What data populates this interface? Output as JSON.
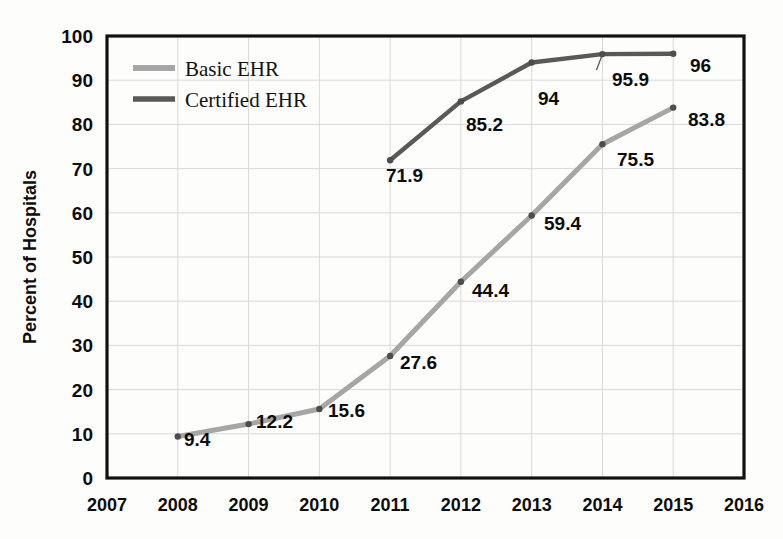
{
  "chart_data": {
    "type": "line",
    "title": "",
    "xlabel": "",
    "ylabel": "Percent of Hospitals",
    "x": [
      2007,
      2008,
      2009,
      2010,
      2011,
      2012,
      2013,
      2014,
      2015,
      2016
    ],
    "categories": [
      "2007",
      "2008",
      "2009",
      "2010",
      "2011",
      "2012",
      "2013",
      "2014",
      "2015",
      "2016"
    ],
    "xlim": [
      2007,
      2016
    ],
    "ylim": [
      0,
      100
    ],
    "ytick_labels": [
      "0",
      "10",
      "20",
      "30",
      "40",
      "50",
      "60",
      "70",
      "80",
      "90",
      "100"
    ],
    "yticks": [
      0,
      10,
      20,
      30,
      40,
      50,
      60,
      70,
      80,
      90,
      100
    ],
    "grid": true,
    "legend_position": "top-left",
    "series": [
      {
        "name": "Basic EHR",
        "color": "#a6a6a6",
        "x": [
          2008,
          2009,
          2010,
          2011,
          2012,
          2013,
          2014,
          2015
        ],
        "values": [
          9.4,
          12.2,
          15.6,
          27.6,
          44.4,
          59.4,
          75.5,
          83.8
        ],
        "labels": [
          "9.4",
          "12.2",
          "15.6",
          "27.6",
          "44.4",
          "59.4",
          "75.5",
          "83.8"
        ]
      },
      {
        "name": "Certified EHR",
        "color": "#595959",
        "x": [
          2011,
          2012,
          2013,
          2014,
          2015
        ],
        "values": [
          71.9,
          85.2,
          94,
          95.9,
          96
        ],
        "labels": [
          "71.9",
          "85.2",
          "94",
          "95.9",
          "96"
        ]
      }
    ],
    "legend": [
      {
        "label": "Basic EHR",
        "color": "#a6a6a6"
      },
      {
        "label": "Certified EHR",
        "color": "#595959"
      }
    ]
  },
  "annotations": {
    "basic": [
      {
        "text": "9.4",
        "x": 184,
        "y": 446,
        "anchor": "start"
      },
      {
        "text": "12.2",
        "x": 256,
        "y": 428,
        "anchor": "start"
      },
      {
        "text": "15.6",
        "x": 328,
        "y": 417,
        "anchor": "start"
      },
      {
        "text": "27.6",
        "x": 400,
        "y": 369,
        "anchor": "start"
      },
      {
        "text": "44.4",
        "x": 472,
        "y": 297,
        "anchor": "start"
      },
      {
        "text": "59.4",
        "x": 544,
        "y": 230,
        "anchor": "start"
      },
      {
        "text": "75.5",
        "x": 617,
        "y": 166,
        "anchor": "start"
      },
      {
        "text": "83.8",
        "x": 688,
        "y": 126,
        "anchor": "start"
      }
    ],
    "certified": [
      {
        "text": "71.9",
        "x": 386,
        "y": 182,
        "anchor": "start"
      },
      {
        "text": "85.2",
        "x": 466,
        "y": 131,
        "anchor": "start"
      },
      {
        "text": "94",
        "x": 538,
        "y": 105,
        "anchor": "start"
      },
      {
        "text": "95.9",
        "x": 612,
        "y": 86,
        "anchor": "start"
      },
      {
        "text": "96",
        "x": 690,
        "y": 72,
        "anchor": "start"
      }
    ]
  },
  "geometry": {
    "plot_left": 107,
    "plot_right": 744,
    "plot_top": 36,
    "plot_bottom": 478,
    "x_step": 70.8,
    "y_step": 44.2
  },
  "colors": {
    "basic_ehr": "#a6a6a6",
    "certified_ehr": "#595959",
    "axis": "#111111",
    "grid": "#d9d9d9",
    "text": "#0d0d0d",
    "background": "#fdfdfc"
  }
}
